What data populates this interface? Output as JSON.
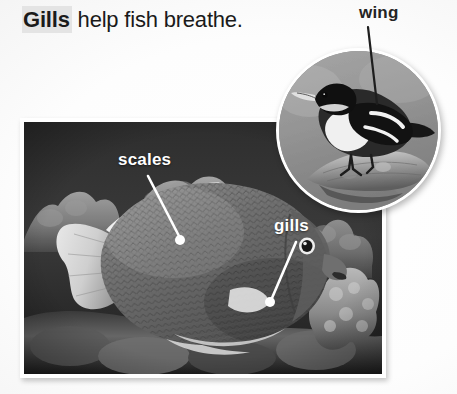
{
  "heading": {
    "keyword": "Gills",
    "rest": " help fish breathe.",
    "keyword_highlight_color": "#e4e4e4",
    "text_color": "#1a1a1a"
  },
  "fish_photo": {
    "alt_name": "angelfish-underwater-photo",
    "subject": "angelfish",
    "setting": "coral reef",
    "style": "grayscale photograph",
    "border_color": "#ffffff"
  },
  "bird_inset": {
    "alt_name": "bird-on-branch-photo",
    "subject": "perching bird",
    "setting": "tree branch",
    "style": "grayscale photograph",
    "shape": "circle",
    "border_color": "#ffffff"
  },
  "callouts": [
    {
      "id": "scales",
      "label": "scales",
      "color": "#ffffff",
      "target": "fish body scales",
      "line_color": "#ffffff",
      "dot_color": "#ffffff"
    },
    {
      "id": "gills",
      "label": "gills",
      "color": "#ffffff",
      "target": "fish gill cover",
      "line_color": "#ffffff",
      "dot_color": "#ffffff"
    },
    {
      "id": "wing",
      "label": "wing",
      "color": "#242424",
      "target": "bird wing",
      "line_color": "#1e1e1e",
      "dot_color": "#1e1e1e"
    }
  ],
  "page": {
    "background_color": "#ffffff"
  }
}
